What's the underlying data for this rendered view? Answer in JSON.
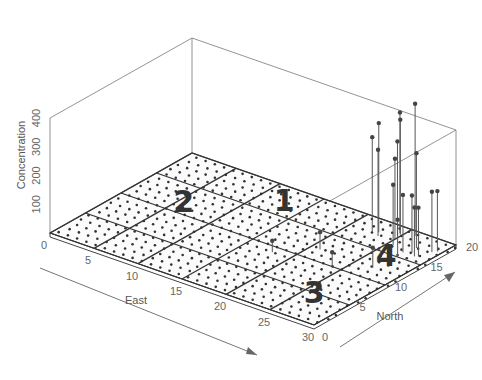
{
  "chart_data": {
    "type": "scatter",
    "subtype": "3d-spike-plot",
    "title": "",
    "xlabel": "East",
    "ylabel": "North",
    "zlabel": "Concentration",
    "x_ticks": [
      "0",
      "5",
      "10",
      "15",
      "20",
      "25",
      "30"
    ],
    "y_ticks": [
      "0",
      "5",
      "10",
      "15",
      "20"
    ],
    "z_ticks": [
      "100",
      "200",
      "300",
      "400"
    ],
    "xlim": [
      0,
      30
    ],
    "ylim": [
      0,
      20
    ],
    "zlim": [
      0,
      400
    ],
    "grid": true,
    "grid_cells": {
      "east_divisions": 6,
      "north_divisions": 4
    },
    "sample_dots_spacing": 1,
    "regions": [
      {
        "label": "1",
        "east": 12.5,
        "north": 17.5
      },
      {
        "label": "2",
        "east": 5.5,
        "north": 12.0
      },
      {
        "label": "3",
        "east": 26.0,
        "north": 5.0
      },
      {
        "label": "4",
        "east": 26.5,
        "north": 14.5
      }
    ],
    "spikes": [
      {
        "east": 22.5,
        "north": 17.5,
        "value": 330
      },
      {
        "east": 23.0,
        "north": 17.8,
        "value": 380
      },
      {
        "east": 23.4,
        "north": 17.2,
        "value": 300
      },
      {
        "east": 24.6,
        "north": 18.8,
        "value": 420
      },
      {
        "east": 24.8,
        "north": 18.6,
        "value": 400
      },
      {
        "east": 24.8,
        "north": 18.2,
        "value": 330
      },
      {
        "east": 26.0,
        "north": 19.2,
        "value": 460
      },
      {
        "east": 25.0,
        "north": 17.6,
        "value": 280
      },
      {
        "east": 25.6,
        "north": 16.6,
        "value": 210
      },
      {
        "east": 27.6,
        "north": 17.4,
        "value": 330
      },
      {
        "east": 27.2,
        "north": 16.0,
        "value": 200
      },
      {
        "east": 27.9,
        "north": 16.4,
        "value": 200
      },
      {
        "east": 29.2,
        "north": 17.6,
        "value": 210
      },
      {
        "east": 29.5,
        "north": 18.0,
        "value": 210
      },
      {
        "east": 28.5,
        "north": 16.0,
        "value": 170
      },
      {
        "east": 28.8,
        "north": 16.2,
        "value": 170
      },
      {
        "east": 27.4,
        "north": 15.0,
        "value": 130
      },
      {
        "east": 21.0,
        "north": 12.0,
        "value": 60
      },
      {
        "east": 24.0,
        "north": 10.0,
        "value": 50
      },
      {
        "east": 18.0,
        "north": 9.0,
        "value": 40
      },
      {
        "east": 27.0,
        "north": 12.0,
        "value": 70
      }
    ],
    "annotations": [
      "1",
      "2",
      "3",
      "4"
    ],
    "axis_arrows": [
      "East",
      "North"
    ]
  }
}
